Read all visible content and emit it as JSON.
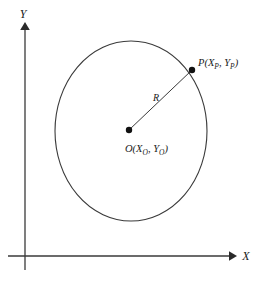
{
  "figure": {
    "type": "geometry-diagram",
    "title": "",
    "background_color": "#ffffff",
    "stroke_color": "#3a3a3a",
    "text_color": "#1a1a1a"
  },
  "axes": {
    "x_axis": {
      "label": "X",
      "icon": "arrow-right-icon",
      "origin_px": {
        "x": 25,
        "y": 256
      },
      "end_px": {
        "x": 232,
        "y": 256
      }
    },
    "y_axis": {
      "label": "Y",
      "icon": "arrow-up-icon",
      "origin_px": {
        "x": 25,
        "y": 268
      },
      "end_px": {
        "x": 25,
        "y": 25
      }
    }
  },
  "shapes": {
    "circle": {
      "name": "circle",
      "center_px": {
        "x": 131,
        "y": 131
      },
      "radius_x_px": 76,
      "radius_y_px": 90,
      "fill": "none",
      "stroke": "#3a3a3a"
    },
    "radius_line": {
      "name": "radius-segment",
      "from_px": {
        "x": 129,
        "y": 130
      },
      "to_px": {
        "x": 192,
        "y": 70
      },
      "label": "R"
    }
  },
  "points": [
    {
      "id": "center",
      "marker": "filled-dot",
      "position_px": {
        "x": 129,
        "y": 130
      },
      "label": {
        "name": "O",
        "open_paren": "(",
        "coord_x_base": "X",
        "coord_x_sub": "O",
        "comma": ", ",
        "coord_y_base": "Y",
        "coord_y_sub": "O",
        "close_paren": ")",
        "full_text": "O(XO, YO)"
      }
    },
    {
      "id": "point-p",
      "marker": "filled-dot",
      "position_px": {
        "x": 192,
        "y": 70
      },
      "label": {
        "name": "P",
        "open_paren": "(",
        "coord_x_base": "X",
        "coord_x_sub": "P",
        "comma": ", ",
        "coord_y_base": "Y",
        "coord_y_sub": "P",
        "close_paren": ")",
        "full_text": "P(XP, YP)"
      }
    }
  ]
}
